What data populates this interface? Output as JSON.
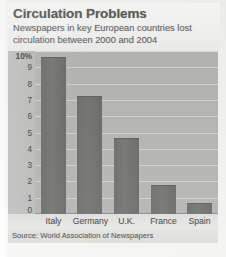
{
  "chart_data": {
    "type": "bar",
    "title": "Circulation Problems",
    "subtitle": "Newspapers in key European countries lost circulation between 2000 and 2004",
    "categories": [
      "Italy",
      "Germany",
      "U.K.",
      "France",
      "Spain"
    ],
    "values": [
      9.6,
      7.2,
      4.6,
      1.7,
      0.6
    ],
    "xlabel": "",
    "ylabel": "",
    "ylim": [
      0,
      10
    ],
    "ytick_labels": [
      "10%",
      "9",
      "8",
      "7",
      "6",
      "5",
      "4",
      "3",
      "2",
      "1",
      "0"
    ],
    "ytick_values": [
      10,
      9,
      8,
      7,
      6,
      5,
      4,
      3,
      2,
      1,
      0
    ],
    "unit": "%",
    "grid": true,
    "legend": "none",
    "source": "Source: World Association of Newspapers",
    "colors": {
      "bar": "#6d6d6b",
      "plot_background": "#b5b5b3",
      "gridline": "#d2d2d0",
      "header_background": "#f6f6f4",
      "title_text": "#5d5d5d",
      "body_text": "#6a6a6a"
    }
  }
}
